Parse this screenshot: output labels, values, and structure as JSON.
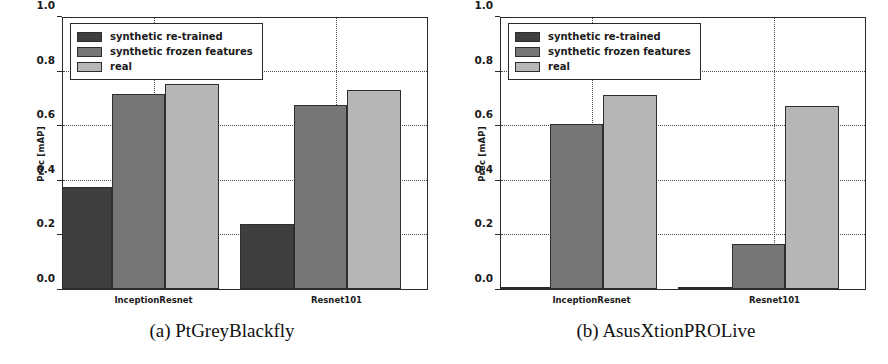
{
  "figure": {
    "panels": [
      {
        "id": "a",
        "caption": "(a) PtGreyBlackfly",
        "chart_index": 0
      },
      {
        "id": "b",
        "caption": "(b) AsusXtionPROLive",
        "chart_index": 1
      }
    ]
  },
  "legend": {
    "entries": [
      {
        "label": "synthetic re-trained",
        "color": "#3f3f3f"
      },
      {
        "label": "synthetic frozen features",
        "color": "#767676"
      },
      {
        "label": "real",
        "color": "#b6b6b6"
      }
    ]
  },
  "axis": {
    "ylabel": "Prec [mAP]",
    "yticks": [
      "0.0",
      "0.2",
      "0.4",
      "0.6",
      "0.8",
      "1.0"
    ],
    "ytick_values": [
      0.0,
      0.2,
      0.4,
      0.6,
      0.8,
      1.0
    ],
    "ylim": [
      0.0,
      1.0
    ],
    "categories": [
      "InceptionResnet",
      "Resnet101"
    ]
  },
  "chart_data": [
    {
      "type": "bar",
      "title": "(a) PtGreyBlackfly",
      "xlabel": "",
      "ylabel": "Prec [mAP]",
      "ylim": [
        0.0,
        1.0
      ],
      "yticks": [
        0.0,
        0.2,
        0.4,
        0.6,
        0.8,
        1.0
      ],
      "grid": true,
      "legend_position": "upper left",
      "categories": [
        "InceptionResnet",
        "Resnet101"
      ],
      "series": [
        {
          "name": "synthetic re-trained",
          "color": "#3f3f3f",
          "values": [
            0.375,
            0.24
          ]
        },
        {
          "name": "synthetic frozen features",
          "color": "#767676",
          "values": [
            0.72,
            0.68
          ]
        },
        {
          "name": "real",
          "color": "#b6b6b6",
          "values": [
            0.755,
            0.735
          ]
        }
      ]
    },
    {
      "type": "bar",
      "title": "(b) AsusXtionPROLive",
      "xlabel": "",
      "ylabel": "Prec [mAP]",
      "ylim": [
        0.0,
        1.0
      ],
      "yticks": [
        0.0,
        0.2,
        0.4,
        0.6,
        0.8,
        1.0
      ],
      "grid": true,
      "legend_position": "upper left",
      "categories": [
        "InceptionResnet",
        "Resnet101"
      ],
      "series": [
        {
          "name": "synthetic re-trained",
          "color": "#3f3f3f",
          "values": [
            0.0,
            0.005
          ]
        },
        {
          "name": "synthetic frozen features",
          "color": "#767676",
          "values": [
            0.61,
            0.165
          ]
        },
        {
          "name": "real",
          "color": "#b6b6b6",
          "values": [
            0.715,
            0.675
          ]
        }
      ]
    }
  ]
}
